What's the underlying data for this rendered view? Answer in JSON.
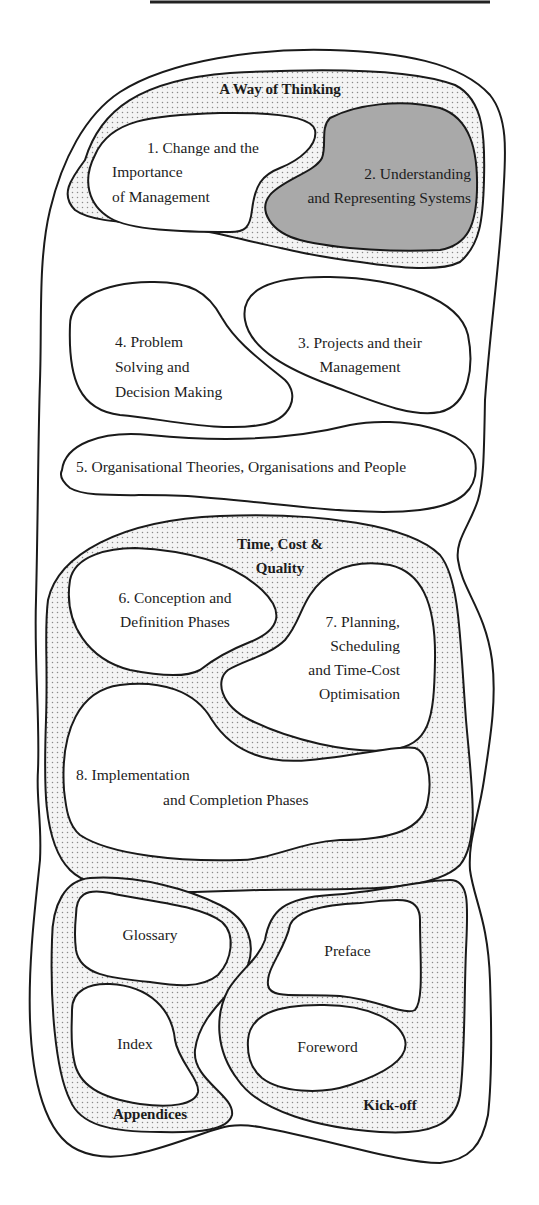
{
  "diagram": {
    "type": "nested-region-map",
    "groups": {
      "way_of_thinking": {
        "label": "A Way of Thinking"
      },
      "time_cost_quality": {
        "label_line1": "Time, Cost &",
        "label_line2": "Quality"
      },
      "appendices": {
        "label": "Appendices"
      },
      "kick_off": {
        "label": "Kick-off"
      }
    },
    "items": {
      "ch1": {
        "line1": "1. Change and the",
        "line2": "Importance",
        "line3": "of Management"
      },
      "ch2": {
        "line1": "2. Understanding",
        "line2": "and Representing Systems",
        "highlighted": true
      },
      "ch3": {
        "line1": "3. Projects and their",
        "line2": "Management"
      },
      "ch4": {
        "line1": "4. Problem",
        "line2": "Solving and",
        "line3": "Decision Making"
      },
      "ch5": {
        "line1": "5. Organisational Theories, Organisations and People"
      },
      "ch6": {
        "line1": "6. Conception and",
        "line2": "Definition Phases"
      },
      "ch7": {
        "line1": "7. Planning,",
        "line2": "Scheduling",
        "line3": "and Time-Cost",
        "line4": "Optimisation"
      },
      "ch8": {
        "line1": "8. Implementation",
        "line2": "and Completion Phases"
      },
      "glossary": {
        "line1": "Glossary"
      },
      "index": {
        "line1": "Index"
      },
      "preface": {
        "line1": "Preface"
      },
      "foreword": {
        "line1": "Foreword"
      }
    },
    "colors": {
      "stroke": "#1a1a1a",
      "highlight_fill": "#a9a9a9",
      "dot_pattern": "#8a8a8a",
      "background": "#ffffff"
    }
  }
}
